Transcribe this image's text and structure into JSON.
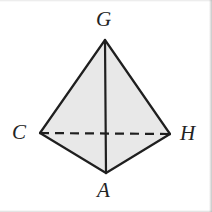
{
  "figure": {
    "kind": "tetrahedron-diagram",
    "background_color": "#ffffff",
    "face_fill_color": "#e8e8e8",
    "edge_color": "#1f1f1f",
    "label_color": "#232323",
    "edge_width": 2.2,
    "hidden_edge_dash": "9,6",
    "vertices": [
      {
        "id": "G",
        "label": "G",
        "x": 105,
        "y": 40,
        "label_x": 96,
        "label_y": 9,
        "position": "apex-top"
      },
      {
        "id": "C",
        "label": "C",
        "x": 40,
        "y": 133,
        "label_x": 12,
        "label_y": 122,
        "position": "left"
      },
      {
        "id": "H",
        "label": "H",
        "x": 170,
        "y": 134,
        "label_x": 180,
        "label_y": 123,
        "position": "right"
      },
      {
        "id": "A",
        "label": "A",
        "x": 106,
        "y": 173,
        "label_x": 97,
        "label_y": 180,
        "position": "bottom-front"
      }
    ],
    "edges": [
      {
        "id": "GC",
        "from": "G",
        "to": "C",
        "style": "solid",
        "hidden": false
      },
      {
        "id": "GH",
        "from": "G",
        "to": "H",
        "style": "solid",
        "hidden": false
      },
      {
        "id": "GA",
        "from": "G",
        "to": "A",
        "style": "solid",
        "hidden": false
      },
      {
        "id": "CA",
        "from": "C",
        "to": "A",
        "style": "solid",
        "hidden": false
      },
      {
        "id": "HA",
        "from": "H",
        "to": "A",
        "style": "solid",
        "hidden": false
      },
      {
        "id": "CH",
        "from": "C",
        "to": "H",
        "style": "dashed",
        "hidden": true
      }
    ],
    "faces": [
      {
        "id": "GCA",
        "vertices": [
          "G",
          "C",
          "A"
        ],
        "shaded": true
      },
      {
        "id": "GHA",
        "vertices": [
          "G",
          "H",
          "A"
        ],
        "shaded": true
      }
    ]
  }
}
